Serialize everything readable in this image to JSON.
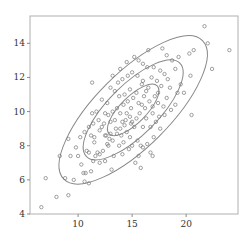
{
  "chart_data": {
    "type": "scatter",
    "title": "",
    "xlabel": "",
    "ylabel": "",
    "xlim": [
      5.55,
      24.8
    ],
    "ylim": [
      4,
      15.6
    ],
    "x_ticks": [
      10,
      15,
      20
    ],
    "y_ticks": [
      4,
      6,
      8,
      10,
      12,
      14
    ],
    "grid": false,
    "legend": null,
    "colors": {
      "points": "#777777",
      "ellipses": "#888888",
      "frame": "#aaaaaa",
      "text": "#333333"
    },
    "ellipses": [
      {
        "cx": 15.1,
        "cy": 10.1,
        "angle_deg": -45,
        "rx_px": 34,
        "ry_px": 13,
        "label": "inner contour"
      },
      {
        "cx": 15.1,
        "cy": 10.1,
        "angle_deg": -45,
        "rx_px": 66,
        "ry_px": 25,
        "label": "middle contour"
      },
      {
        "cx": 15.1,
        "cy": 10.1,
        "angle_deg": -45,
        "rx_px": 98,
        "ry_px": 37,
        "label": "outer contour"
      }
    ],
    "points": [
      [
        6.6,
        4.4
      ],
      [
        7.0,
        6.1
      ],
      [
        8.0,
        5.0
      ],
      [
        8.3,
        7.4
      ],
      [
        8.8,
        6.1
      ],
      [
        9.1,
        5.1
      ],
      [
        9.3,
        7.4
      ],
      [
        9.6,
        6.0
      ],
      [
        9.1,
        8.4
      ],
      [
        10.0,
        7.4
      ],
      [
        10.3,
        6.9
      ],
      [
        10.5,
        6.4
      ],
      [
        10.6,
        5.9
      ],
      [
        10.7,
        6.4
      ],
      [
        11.0,
        5.8
      ],
      [
        11.2,
        6.5
      ],
      [
        10.8,
        7.7
      ],
      [
        11.0,
        7.6
      ],
      [
        11.4,
        7.1
      ],
      [
        11.6,
        7.4
      ],
      [
        11.2,
        8.6
      ],
      [
        11.5,
        8.5
      ],
      [
        11.8,
        7.6
      ],
      [
        12.0,
        7.5
      ],
      [
        12.3,
        7.7
      ],
      [
        12.5,
        8.6
      ],
      [
        11.5,
        8.2
      ],
      [
        11.3,
        11.7
      ],
      [
        12.7,
        8.1
      ],
      [
        12.8,
        8.0
      ],
      [
        12.6,
        8.6
      ],
      [
        13.0,
        8.7
      ],
      [
        13.2,
        8.3
      ],
      [
        13.5,
        9.0
      ],
      [
        13.0,
        9.4
      ],
      [
        13.4,
        9.5
      ],
      [
        12.2,
        9.1
      ],
      [
        12.4,
        9.3
      ],
      [
        12.0,
        8.9
      ],
      [
        12.8,
        9.8
      ],
      [
        13.2,
        10.0
      ],
      [
        13.6,
        10.2
      ],
      [
        13.9,
        9.9
      ],
      [
        14.1,
        9.4
      ],
      [
        14.3,
        9.2
      ],
      [
        14.0,
        8.6
      ],
      [
        14.5,
        8.8
      ],
      [
        14.8,
        8.5
      ],
      [
        14.9,
        9.3
      ],
      [
        15.2,
        9.1
      ],
      [
        15.4,
        9.6
      ],
      [
        15.0,
        8.0
      ],
      [
        14.7,
        7.8
      ],
      [
        15.5,
        8.3
      ],
      [
        15.8,
        8.0
      ],
      [
        16.0,
        7.9
      ],
      [
        16.4,
        8.1
      ],
      [
        16.7,
        7.6
      ],
      [
        16.9,
        7.4
      ],
      [
        15.6,
        7.4
      ],
      [
        15.3,
        7.0
      ],
      [
        14.1,
        7.5
      ],
      [
        14.5,
        9.9
      ],
      [
        14.2,
        10.4
      ],
      [
        14.6,
        10.6
      ],
      [
        14.9,
        10.2
      ],
      [
        15.1,
        10.8
      ],
      [
        15.6,
        10.5
      ],
      [
        15.9,
        10.4
      ],
      [
        16.1,
        10.9
      ],
      [
        15.4,
        11.1
      ],
      [
        14.8,
        11.3
      ],
      [
        14.3,
        11.0
      ],
      [
        13.8,
        10.9
      ],
      [
        13.4,
        11.2
      ],
      [
        13.0,
        11.4
      ],
      [
        13.7,
        11.7
      ],
      [
        14.1,
        11.9
      ],
      [
        14.6,
        12.1
      ],
      [
        15.0,
        12.3
      ],
      [
        15.5,
        12.1
      ],
      [
        15.9,
        11.6
      ],
      [
        16.3,
        11.2
      ],
      [
        16.6,
        10.6
      ],
      [
        16.9,
        10.3
      ],
      [
        17.1,
        10.9
      ],
      [
        17.4,
        11.1
      ],
      [
        17.7,
        11.5
      ],
      [
        17.3,
        11.8
      ],
      [
        16.8,
        12.0
      ],
      [
        16.4,
        12.6
      ],
      [
        16.0,
        12.8
      ],
      [
        15.6,
        13.0
      ],
      [
        17.0,
        12.6
      ],
      [
        17.6,
        12.4
      ],
      [
        18.0,
        12.2
      ],
      [
        18.3,
        11.9
      ],
      [
        18.5,
        11.4
      ],
      [
        18.2,
        10.8
      ],
      [
        17.9,
        10.3
      ],
      [
        17.5,
        9.7
      ],
      [
        17.2,
        9.4
      ],
      [
        16.7,
        9.1
      ],
      [
        16.3,
        9.6
      ],
      [
        16.0,
        9.1
      ],
      [
        18.6,
        10.1
      ],
      [
        19.0,
        10.4
      ],
      [
        19.2,
        11.1
      ],
      [
        19.5,
        11.6
      ],
      [
        19.0,
        12.5
      ],
      [
        18.7,
        13.0
      ],
      [
        19.3,
        13.2
      ],
      [
        20.3,
        13.4
      ],
      [
        20.7,
        13.6
      ],
      [
        20.4,
        12.1
      ],
      [
        21.7,
        15.0
      ],
      [
        22.0,
        14.0
      ],
      [
        24.0,
        13.6
      ],
      [
        22.4,
        12.5
      ],
      [
        17.8,
        13.7
      ],
      [
        16.5,
        13.6
      ],
      [
        18.2,
        13.3
      ],
      [
        19.8,
        11.1
      ],
      [
        20.5,
        9.8
      ],
      [
        17.0,
        8.5
      ],
      [
        15.8,
        6.7
      ],
      [
        13.8,
        8.0
      ],
      [
        13.3,
        7.4
      ],
      [
        12.5,
        7.1
      ],
      [
        12.0,
        7.0
      ],
      [
        13.1,
        6.6
      ],
      [
        12.5,
        9.9
      ],
      [
        11.9,
        9.5
      ],
      [
        11.7,
        10.0
      ],
      [
        11.3,
        9.9
      ],
      [
        12.2,
        10.7
      ],
      [
        12.7,
        10.5
      ],
      [
        13.2,
        12.1
      ],
      [
        13.9,
        12.5
      ],
      [
        14.5,
        12.9
      ],
      [
        15.2,
        13.2
      ],
      [
        16.0,
        11.8
      ],
      [
        16.5,
        11.4
      ],
      [
        17.4,
        10.5
      ],
      [
        18.0,
        9.8
      ],
      [
        15.7,
        9.9
      ],
      [
        14.8,
        9.7
      ],
      [
        14.4,
        9.5
      ],
      [
        13.9,
        9.0
      ],
      [
        13.6,
        8.7
      ],
      [
        15.0,
        9.4
      ],
      [
        16.2,
        10.2
      ],
      [
        16.9,
        9.9
      ],
      [
        17.6,
        9.0
      ],
      [
        12.9,
        8.4
      ],
      [
        14.2,
        8.2
      ],
      [
        11.4,
        9.3
      ],
      [
        10.6,
        8.8
      ],
      [
        10.2,
        8.5
      ],
      [
        11.0,
        9.1
      ],
      [
        9.8,
        7.9
      ]
    ]
  }
}
